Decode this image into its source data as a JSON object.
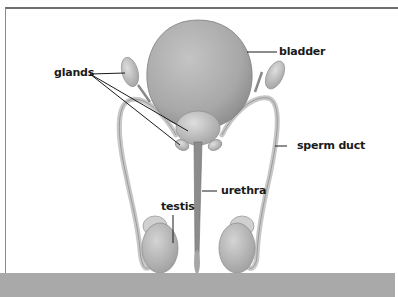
{
  "diagram": {
    "labels": {
      "glands": "glands",
      "bladder": "bladder",
      "sperm_duct": "sperm duct",
      "urethra": "urethra",
      "testis": "testis"
    },
    "colors": {
      "organ_fill": "#b5b5b5",
      "organ_dark": "#8f8f8f",
      "organ_light": "#d6d6d6",
      "leader_line": "#1a1a1a",
      "frame_border": "#6e6e6e",
      "bottom_band": "#a9a9a9"
    }
  }
}
